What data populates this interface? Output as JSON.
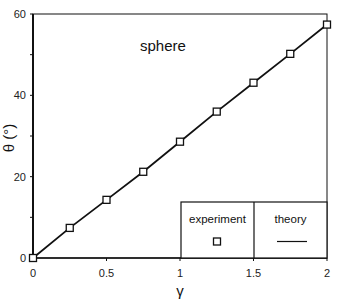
{
  "chart_data": {
    "type": "line",
    "title": "",
    "annotation": "sphere",
    "xlabel": "γ",
    "ylabel": "θ (°)",
    "xlim": [
      0,
      2
    ],
    "ylim": [
      0,
      60
    ],
    "grid": false,
    "x_ticks": [
      "0",
      "0.5",
      "1",
      "1.5",
      "2"
    ],
    "y_ticks": [
      "0",
      "20",
      "40",
      "60"
    ],
    "legend_position": "lower right (table style)",
    "legend": [
      {
        "label": "experiment",
        "marker": "open-square"
      },
      {
        "label": "theory",
        "marker": "solid-line"
      }
    ],
    "series": [
      {
        "name": "experiment",
        "style": "open-square markers",
        "x": [
          0,
          0.25,
          0.5,
          0.75,
          1.0,
          1.25,
          1.5,
          1.75,
          2.0
        ],
        "y": [
          0,
          7.4,
          14.3,
          21.2,
          28.6,
          36.0,
          43.1,
          50.2,
          57.4
        ]
      },
      {
        "name": "theory",
        "style": "solid line",
        "x": [
          0,
          0.25,
          0.5,
          0.75,
          1.0,
          1.25,
          1.5,
          1.75,
          2.0
        ],
        "y": [
          0,
          7.4,
          14.3,
          21.2,
          28.6,
          36.0,
          43.1,
          50.2,
          57.4
        ]
      }
    ]
  }
}
